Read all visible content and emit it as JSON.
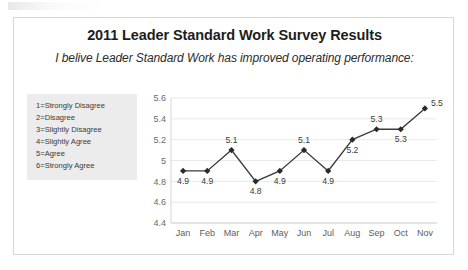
{
  "card": {
    "title": "2011 Leader Standard Work Survey Results",
    "subtitle": "I belive Leader Standard Work has improved operating performance:"
  },
  "legend": {
    "items": [
      "1=Strongly Disagree",
      "2=Disagree",
      "3=Slightly Disagree",
      "4=Slightly Agree",
      "5=Agree",
      "6=Strongly Agree"
    ]
  },
  "chart_data": {
    "type": "line",
    "title": "2011 Leader Standard Work Survey Results",
    "subtitle": "I belive Leader Standard Work has improved operating performance:",
    "categories": [
      "Jan",
      "Feb",
      "Mar",
      "Apr",
      "May",
      "Jun",
      "Jul",
      "Aug",
      "Sep",
      "Oct",
      "Nov"
    ],
    "values": [
      4.9,
      4.9,
      5.1,
      4.8,
      4.9,
      5.1,
      4.9,
      5.2,
      5.3,
      5.3,
      5.5
    ],
    "point_labels": [
      "4.9",
      "4.9",
      "5.1",
      "4.8",
      "4.9",
      "5.1",
      "4.9",
      "5.2",
      "5.3",
      "5.3",
      "5.5"
    ],
    "label_positions": [
      "below",
      "below",
      "above",
      "below",
      "below",
      "above",
      "below",
      "below",
      "above",
      "below",
      "above-right"
    ],
    "xlabel": "",
    "ylabel": "",
    "ylim": [
      4.4,
      5.6
    ],
    "yticks": [
      4.4,
      4.6,
      4.8,
      5.0,
      5.2,
      5.4,
      5.6
    ],
    "ytick_labels": [
      "4.4",
      "4.6",
      "4.8",
      "5",
      "5.2",
      "5.4",
      "5.6"
    ],
    "grid": true,
    "legend_position": "left-box",
    "series_color": "#3b3b3b",
    "marker": "diamond"
  }
}
